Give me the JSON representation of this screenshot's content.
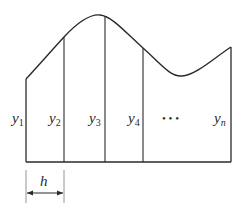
{
  "diagram": {
    "colors": {
      "stroke": "#2a2a2a",
      "background": "#ffffff"
    },
    "ordinates": [
      {
        "base": "y",
        "sub": "1"
      },
      {
        "base": "y",
        "sub": "2"
      },
      {
        "base": "y",
        "sub": "3"
      },
      {
        "base": "y",
        "sub": "4"
      },
      {
        "base": "y",
        "sub": "n"
      }
    ],
    "ellipsis": "• • •",
    "width_label": "h"
  }
}
